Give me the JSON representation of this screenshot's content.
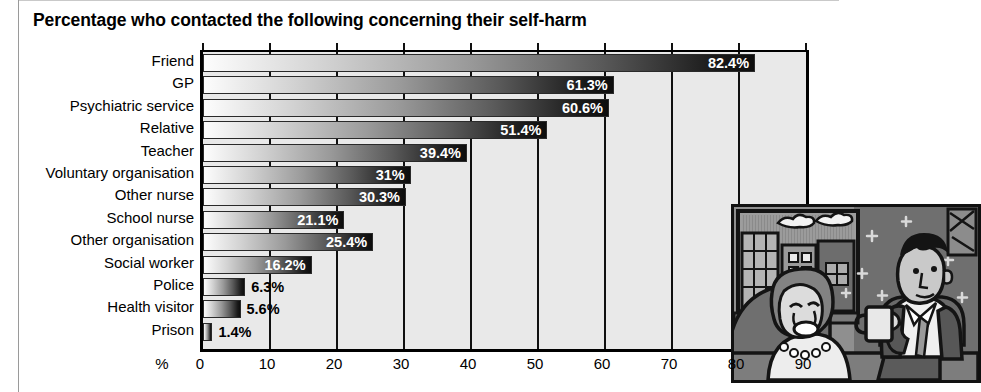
{
  "chart_title": "Percentage who contacted the following concerning their self-harm",
  "axis": {
    "x_unit_label": "%",
    "x_ticks": [
      0,
      10,
      20,
      30,
      40,
      50,
      60,
      70,
      80,
      90
    ],
    "x_min": 0,
    "x_max": 90
  },
  "illustration": {
    "name": "cartoon-two-people-talking",
    "description": "Cartoon of a distressed woman seated talking with a man holding a mug, city buildings through a window"
  },
  "chart_data": {
    "type": "bar",
    "orientation": "horizontal",
    "title": "Percentage who contacted the following concerning their self-harm",
    "xlabel": "%",
    "ylabel": "",
    "xlim": [
      0,
      90
    ],
    "grid": true,
    "legend": "none",
    "categories": [
      "Friend",
      "GP",
      "Psychiatric service",
      "Relative",
      "Teacher",
      "Voluntary organisation",
      "Other nurse",
      "School nurse",
      "Other organisation",
      "Social worker",
      "Police",
      "Health visitor",
      "Prison"
    ],
    "values": [
      82.4,
      61.3,
      60.6,
      51.4,
      39.4,
      31,
      30.3,
      21.1,
      25.4,
      16.2,
      6.3,
      5.6,
      1.4
    ],
    "value_labels": [
      "82.4%",
      "61.3%",
      "60.6%",
      "51.4%",
      "39.4%",
      "31%",
      "30.3%",
      "21.1%",
      "25.4%",
      "16.2%",
      "6.3%",
      "5.6%",
      "1.4%"
    ]
  }
}
